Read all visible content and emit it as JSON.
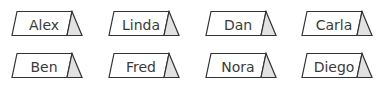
{
  "cards": [
    {
      "name": "Alex"
    },
    {
      "name": "Linda"
    },
    {
      "name": "Dan"
    },
    {
      "name": "Carla"
    },
    {
      "name": "Ben"
    },
    {
      "name": "Fred"
    },
    {
      "name": "Nora"
    },
    {
      "name": "Diego"
    }
  ],
  "colors": {
    "stroke": "#333333",
    "side_fill": "#e2e2e2",
    "text": "#3a3a3a"
  }
}
